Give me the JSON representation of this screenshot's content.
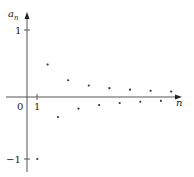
{
  "chart_data": {
    "type": "scatter",
    "title": "",
    "xlabel": "n",
    "ylabel": "a_n",
    "formula_implied": "a_n = (-1)^n / n",
    "x": [
      1,
      2,
      3,
      4,
      5,
      6,
      7,
      8,
      9,
      10,
      11,
      12,
      13,
      14
    ],
    "values": [
      -1,
      0.5,
      -0.333,
      0.25,
      -0.2,
      0.167,
      -0.143,
      0.125,
      -0.111,
      0.1,
      -0.091,
      0.083,
      -0.077,
      0.071
    ],
    "x_ticks": [
      "0",
      "1"
    ],
    "y_ticks": [
      "1",
      "-1"
    ],
    "grid": false,
    "legend": null
  },
  "labels": {
    "y_axis": "a",
    "y_axis_sub": "n",
    "x_axis": "n",
    "origin": "0",
    "x_tick_1": "1",
    "y_tick_pos": "1",
    "y_tick_neg": "−1"
  },
  "colors": {
    "axis": "#555555",
    "point": "#333333"
  }
}
